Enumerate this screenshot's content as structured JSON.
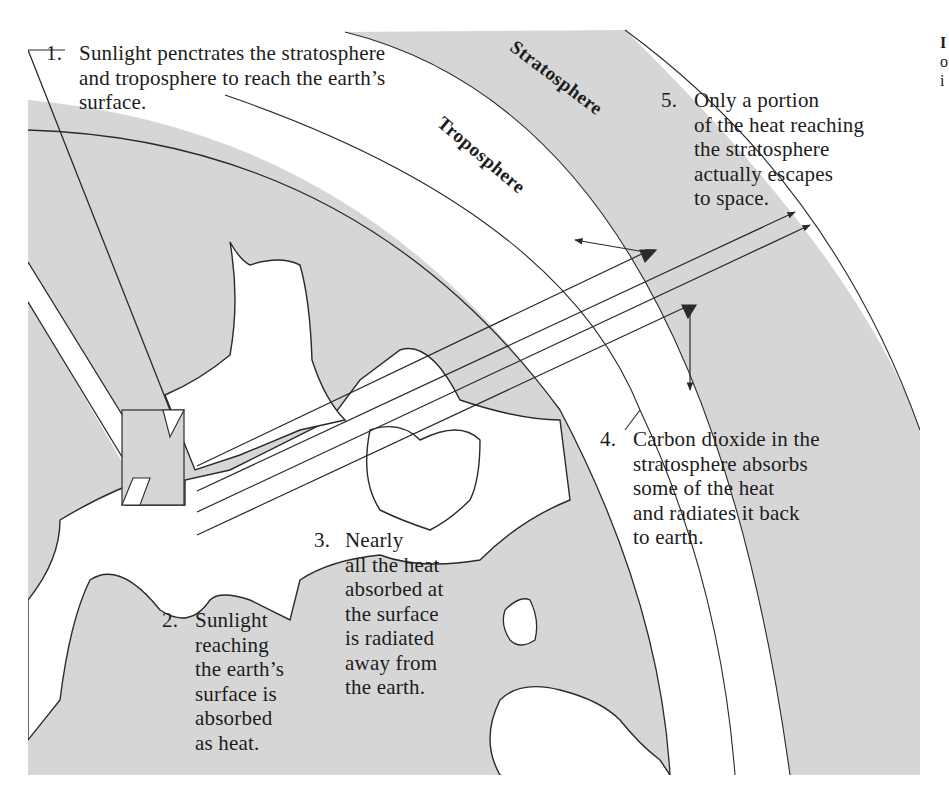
{
  "diagram": {
    "title_fragment": [
      "I",
      "o",
      "i"
    ],
    "layers": {
      "stratosphere": "Stratosphere",
      "troposphere": "Troposphere"
    },
    "steps": [
      {
        "num": "1.",
        "lines": [
          "Sunlight penctrates the stratosphere",
          "and troposphere to reach the earth’s",
          "surface."
        ]
      },
      {
        "num": "2.",
        "lines": [
          "Sunlight",
          "reaching",
          "the earth’s",
          "surface is",
          "absorbed",
          "as heat."
        ]
      },
      {
        "num": "3.",
        "lines": [
          "Nearly",
          "all the heat",
          "absorbed at",
          "the surface",
          "is radiated",
          "away from",
          "the earth."
        ]
      },
      {
        "num": "4.",
        "lines": [
          "Carbon dioxide in the",
          "stratosphere absorbs",
          "some of the heat",
          "and radiates it back",
          "to earth."
        ]
      },
      {
        "num": "5.",
        "lines": [
          "Only a portion",
          "of the heat reaching",
          "the stratosphere",
          "actually escapes",
          "to space."
        ]
      }
    ],
    "colors": {
      "background": "#ffffff",
      "band_gray": "#d6d6d6",
      "line": "#2a2a2a",
      "text": "#1c1c1c"
    }
  }
}
